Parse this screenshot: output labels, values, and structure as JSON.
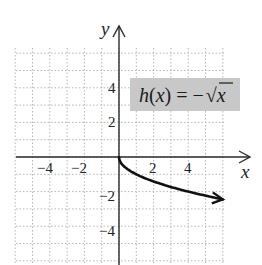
{
  "chart_data": {
    "type": "line",
    "title": "",
    "function_label": "h(x) = −√x",
    "xlabel": "x",
    "ylabel": "y",
    "xlim": [
      -6,
      7.5
    ],
    "ylim": [
      -6.2,
      7.3
    ],
    "grid": true,
    "x_ticks": [
      -4,
      -2,
      2,
      4
    ],
    "y_ticks": [
      4,
      2,
      -2,
      -4
    ],
    "series": [
      {
        "name": "h(x) = −√x",
        "x": [
          0,
          0.25,
          0.5,
          1,
          2,
          3,
          4,
          5,
          6
        ],
        "y": [
          0,
          -0.5,
          -0.71,
          -1,
          -1.41,
          -1.73,
          -2,
          -2.24,
          -2.45
        ]
      }
    ]
  },
  "labels": {
    "x_axis": "x",
    "y_axis": "y",
    "ticks_x": [
      "−4",
      "−2",
      "2",
      "4"
    ],
    "ticks_y": [
      "4",
      "2",
      "−2",
      "−4"
    ],
    "equation_h": "h",
    "equation_paren_open": "(",
    "equation_x": "x",
    "equation_rest": ") = −",
    "equation_sqrt_x": "x"
  },
  "colors": {
    "axis": "#2a2a2a",
    "grid": "#b0b0b0",
    "curve": "#111111",
    "label_box": "#c8c8c8"
  }
}
